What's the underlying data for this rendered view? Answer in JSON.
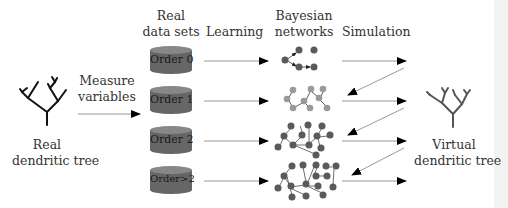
{
  "left": {
    "line1": "Real",
    "line2": "dendritic tree"
  },
  "measure": {
    "line1": "Measure",
    "line2": "variables"
  },
  "datasets_header": {
    "line1": "Real",
    "line2": "data sets"
  },
  "learning": "Learning",
  "bn_header": {
    "line1": "Bayesian",
    "line2": "networks"
  },
  "simulation": "Simulation",
  "right": {
    "line1": "Virtual",
    "line2": "dendritic tree"
  },
  "datasets": [
    {
      "label": "Order 0"
    },
    {
      "label": "Order 1"
    },
    {
      "label": "Order 2"
    },
    {
      "label": "Order>2"
    }
  ],
  "colors": {
    "cylinder": "#666666",
    "node_dark": "#5a5a5a",
    "node_light": "#9a9a9a",
    "arrow": "#000000",
    "line": "#999999"
  }
}
